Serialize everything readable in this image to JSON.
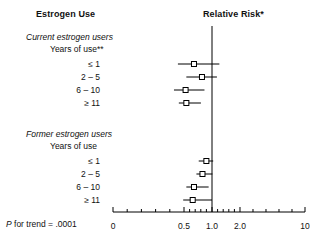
{
  "figure": {
    "column_headers": {
      "left": "Estrogen Use",
      "right": "Relative Risk*"
    },
    "footnote": {
      "p_label": "P",
      "p_text": " for trend = .0001"
    }
  },
  "chart_data": {
    "type": "forest",
    "title": "",
    "xlabel": "Relative Risk*",
    "ylabel": "Estrogen Use",
    "scale": "log",
    "xlim": [
      0.3,
      10
    ],
    "reference_line": 1.0,
    "grid": false,
    "legend": "none",
    "tick_labels": [
      "0",
      "0.5",
      "1.0",
      "2.0",
      "10"
    ],
    "tick_values": [
      0,
      0.5,
      1.0,
      2.0,
      10
    ],
    "groups": [
      {
        "name": "Current estrogen users",
        "subheading": "Years of use**",
        "rows": [
          {
            "label": "≤ 1",
            "rr": 0.64,
            "ci_low": 0.43,
            "ci_high": 1.2
          },
          {
            "label": "2 – 5",
            "rr": 0.78,
            "ci_low": 0.53,
            "ci_high": 1.13
          },
          {
            "label": "6 – 10",
            "rr": 0.52,
            "ci_low": 0.39,
            "ci_high": 0.83
          },
          {
            "label": "≥ 11",
            "rr": 0.53,
            "ci_low": 0.44,
            "ci_high": 0.76
          }
        ]
      },
      {
        "name": "Former estrogen users",
        "subheading": "Years of use",
        "rows": [
          {
            "label": "≤ 1",
            "rr": 0.87,
            "ci_low": 0.72,
            "ci_high": 1.03
          },
          {
            "label": "2 – 5",
            "rr": 0.79,
            "ci_low": 0.68,
            "ci_high": 1.01
          },
          {
            "label": "6 – 10",
            "rr": 0.64,
            "ci_low": 0.53,
            "ci_high": 0.92
          },
          {
            "label": "≥ 11",
            "rr": 0.62,
            "ci_low": 0.49,
            "ci_high": 1.0
          }
        ]
      }
    ]
  },
  "axis_geometry": {
    "x_zero_px": 113,
    "x_one_px": 212,
    "x_end_px": 305,
    "axis_y_px": 212,
    "row_ys": [
      64,
      77,
      90,
      103,
      161,
      174,
      187,
      200
    ],
    "vline_top_px": 26,
    "vline_bottom_px": 212
  }
}
